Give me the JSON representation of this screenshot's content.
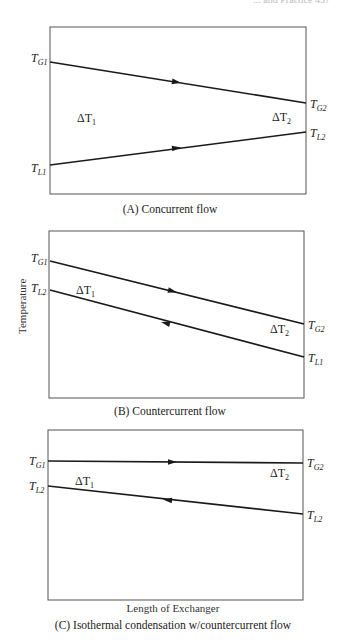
{
  "header_fragment": "... and Practice 457",
  "axes": {
    "y_label": "Temperature",
    "x_label": "Length of Exchanger"
  },
  "panels": [
    {
      "id": "A",
      "caption": "(A) Concurrent flow",
      "lines": [
        {
          "name": "gas",
          "start_label": "T",
          "start_sub": "G1",
          "end_label": "T",
          "end_sub": "G2",
          "direction": "left-to-right"
        },
        {
          "name": "liquid",
          "start_label": "T",
          "start_sub": "L1",
          "end_label": "T",
          "end_sub": "L2",
          "direction": "left-to-right"
        }
      ],
      "delta_left": {
        "sym": "ΔT",
        "sub": "1"
      },
      "delta_right": {
        "sym": "ΔT",
        "sub": "2"
      }
    },
    {
      "id": "B",
      "caption": "(B) Countercurrent flow",
      "lines": [
        {
          "name": "gas",
          "start_label": "T",
          "start_sub": "G1",
          "end_label": "T",
          "end_sub": "G2",
          "direction": "left-to-right"
        },
        {
          "name": "liquid",
          "start_label": "T",
          "start_sub": "L2",
          "end_label": "T",
          "end_sub": "L1",
          "direction": "right-to-left"
        }
      ],
      "delta_left": {
        "sym": "ΔT",
        "sub": "1"
      },
      "delta_right": {
        "sym": "ΔT",
        "sub": "2"
      }
    },
    {
      "id": "C",
      "caption": "(C) Isothermal condensation w/countercurrent flow",
      "lines": [
        {
          "name": "gas",
          "start_label": "T",
          "start_sub": "G1",
          "end_label": "T",
          "end_sub": "G2",
          "direction": "left-to-right"
        },
        {
          "name": "liquid",
          "start_label": "T",
          "start_sub": "L2",
          "end_label": "T",
          "end_sub": "L2",
          "direction": "right-to-left"
        }
      ],
      "delta_left": {
        "sym": "ΔT",
        "sub": "1"
      },
      "delta_right": {
        "sym": "ΔT",
        "sub": "2"
      }
    }
  ],
  "colors": {
    "line": "#1a1a1a",
    "frame": "#555555",
    "text": "#222222"
  }
}
